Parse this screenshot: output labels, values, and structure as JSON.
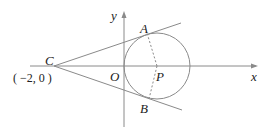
{
  "diagram": {
    "axes": {
      "x_label": "x",
      "y_label": "y",
      "origin_label": "O"
    },
    "points": {
      "C": {
        "label": "C",
        "coord_text": "( −2,  0 )"
      },
      "A": {
        "label": "A"
      },
      "B": {
        "label": "B"
      },
      "P": {
        "label": "P"
      }
    }
  },
  "colors": {
    "line": "#8a8a8a",
    "text": "#222222",
    "background": "#ffffff"
  }
}
